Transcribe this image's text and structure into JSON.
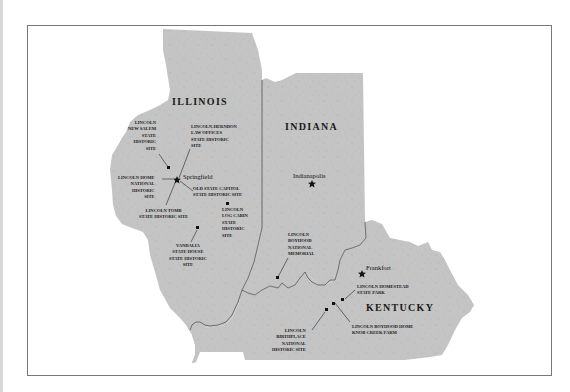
{
  "map": {
    "colors": {
      "land": "#c4c4c4",
      "border": "#555555",
      "frame": "#777777",
      "text": "#1a1a1a"
    },
    "states": [
      {
        "name": "ILLINOIS"
      },
      {
        "name": "INDIANA"
      },
      {
        "name": "KENTUCKY"
      }
    ],
    "capitals": [
      {
        "name": "Springfield",
        "state": "ILLINOIS",
        "icon": "star-icon"
      },
      {
        "name": "Indianapolis",
        "state": "INDIANA",
        "icon": "star-icon"
      },
      {
        "name": "Frankfort",
        "state": "KENTUCKY",
        "icon": "star-icon"
      }
    ],
    "sites": [
      {
        "lines": [
          "LINCOLN",
          "NEW SALEM",
          "STATE",
          "HISTORIC",
          "SITE"
        ],
        "icon": "square-marker-icon"
      },
      {
        "lines": [
          "LINCOLN-HERNDON",
          "LAW OFFICES",
          "STATE HISTORIC",
          "SITE"
        ],
        "icon": "square-marker-icon"
      },
      {
        "lines": [
          "LINCOLN HOME",
          "NATIONAL",
          "HISTORIC",
          "SITE"
        ],
        "icon": "square-marker-icon"
      },
      {
        "lines": [
          "OLD STATE CAPITOL",
          "STATE HISTORIC SITE"
        ],
        "icon": "square-marker-icon"
      },
      {
        "lines": [
          "LINCOLN TOMB",
          "STATE HISTORIC SITE"
        ],
        "icon": "square-marker-icon"
      },
      {
        "lines": [
          "LINCOLN",
          "LOG CABIN",
          "STATE",
          "HISTORIC",
          "SITE"
        ],
        "icon": "square-marker-icon"
      },
      {
        "lines": [
          "VANDALIA",
          "STATE HOUSE",
          "STATE HISTORIC",
          "SITE"
        ],
        "icon": "square-marker-icon"
      },
      {
        "lines": [
          "LINCOLN",
          "BOYHOOD",
          "NATIONAL",
          "MEMORIAL"
        ],
        "icon": "square-marker-icon"
      },
      {
        "lines": [
          "LINCOLN HOMESTEAD",
          "STATE PARK"
        ],
        "icon": "square-marker-icon"
      },
      {
        "lines": [
          "LINCOLN BOYHOOD HOME",
          "KNOB CREEK FARM"
        ],
        "icon": "square-marker-icon"
      },
      {
        "lines": [
          "LINCOLN",
          "BIRTHPLACE",
          "NATIONAL",
          "HISTORIC SITE"
        ],
        "icon": "square-marker-icon"
      }
    ]
  }
}
